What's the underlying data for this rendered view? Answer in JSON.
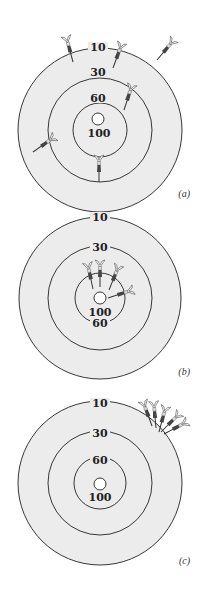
{
  "figure": {
    "colors": {
      "background": "#ffffff",
      "board_fill": "#ececec",
      "ring_stroke": "#222222",
      "dart_dark": "#333333",
      "dart_mid": "#777777",
      "flight": "#ffffff"
    },
    "ring_labels": [
      "10",
      "30",
      "60",
      "100"
    ],
    "panels": [
      {
        "id": "a",
        "caption": "(a)",
        "description": "darts scattered across board (neither accurate nor precise)",
        "labels": {
          "outer": "10",
          "r30": "30",
          "r60": "60",
          "bull": "100"
        }
      },
      {
        "id": "b",
        "caption": "(b)",
        "description": "darts clustered near center (accurate and precise)",
        "labels": {
          "outer": "10",
          "r30": "30",
          "r60": "100",
          "bull": "60"
        }
      },
      {
        "id": "c",
        "caption": "(c)",
        "description": "darts clustered at edge (precise but not accurate)",
        "labels": {
          "outer": "10",
          "r30": "30",
          "r60": "60",
          "bull": "100"
        }
      }
    ]
  }
}
